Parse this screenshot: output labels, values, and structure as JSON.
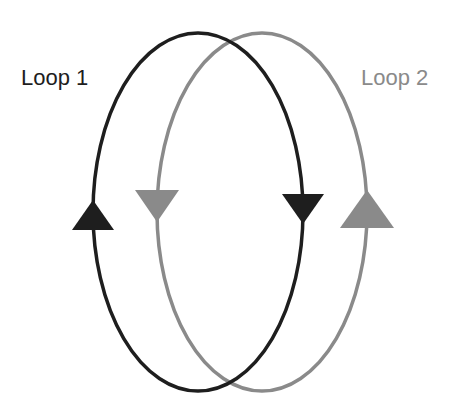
{
  "diagram": {
    "loops": [
      {
        "id": "loop1",
        "label": "Loop 1",
        "color": "#1e1e1e",
        "direction": "clockwise",
        "ellipse": {
          "cx": 198,
          "cy": 212,
          "rx": 105,
          "ry": 179
        },
        "arrows": [
          {
            "side": "left",
            "direction": "up",
            "x": 93,
            "y_apex": 200,
            "y_base": 230
          },
          {
            "side": "right",
            "direction": "down",
            "x": 303,
            "y_apex": 224,
            "y_base": 194
          }
        ]
      },
      {
        "id": "loop2",
        "label": "Loop 2",
        "color": "#8a8a8a",
        "direction": "counter-clockwise",
        "ellipse": {
          "cx": 262,
          "cy": 212,
          "rx": 105,
          "ry": 179
        },
        "arrows": [
          {
            "side": "left",
            "direction": "down",
            "x": 157,
            "y_apex": 222,
            "y_base": 190
          },
          {
            "side": "right",
            "direction": "up",
            "x": 367,
            "y_apex": 190,
            "y_base": 228
          }
        ]
      }
    ]
  }
}
